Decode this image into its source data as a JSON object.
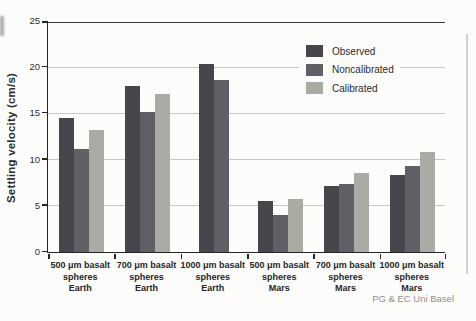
{
  "figure": {
    "attribution": "PG & EC Uni Basel"
  },
  "colors": {
    "background": "#fcfcfa",
    "axis": "#262626",
    "gridline": "#c9c9c9",
    "observed": "#48464c",
    "noncalibrated": "#615f66",
    "calibrated": "#a9aca2",
    "attribution_text": "#909090"
  },
  "chart_data": {
    "type": "bar",
    "title": "",
    "xlabel": "",
    "ylabel": "Settling velocity (cm/s)",
    "ylim": [
      0,
      25
    ],
    "yticks": [
      0,
      5,
      10,
      15,
      20,
      25
    ],
    "grid": true,
    "legend_position": "inside upper right",
    "categories": [
      "500 μm basalt spheres Earth",
      "700 μm basalt spheres Earth",
      "1000 μm basalt spheres Earth",
      "500 μm basalt spheres Mars",
      "700 μm basalt spheres Mars",
      "1000 μm basalt spheres Mars"
    ],
    "category_lines": [
      [
        "500 μm basalt",
        "spheres",
        "Earth"
      ],
      [
        "700 μm basalt",
        "spheres",
        "Earth"
      ],
      [
        "1000 μm basalt",
        "spheres",
        "Earth"
      ],
      [
        "500 μm basalt",
        "spheres",
        "Mars"
      ],
      [
        "700 μm basalt",
        "spheres",
        "Mars"
      ],
      [
        "1000 μm basalt",
        "spheres",
        "Mars"
      ]
    ],
    "series": [
      {
        "name": "Observed",
        "color": "#48464c",
        "values": [
          14.5,
          18.0,
          20.3,
          5.5,
          7.1,
          8.3
        ]
      },
      {
        "name": "Noncalibrated",
        "color": "#615f66",
        "values": [
          11.1,
          15.2,
          18.6,
          4.0,
          7.4,
          9.3
        ]
      },
      {
        "name": "Calibrated",
        "color": "#a9aca2",
        "values": [
          13.2,
          17.1,
          null,
          5.7,
          8.6,
          10.8
        ]
      }
    ],
    "note": "Calibrated bar absent in 1000 μm basalt spheres Earth group"
  }
}
